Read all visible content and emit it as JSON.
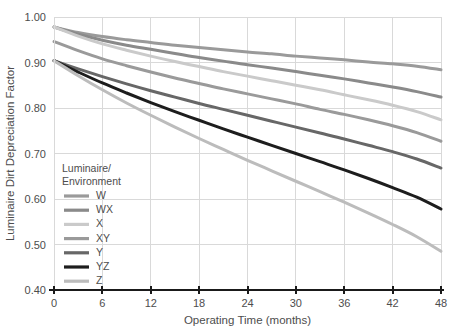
{
  "chart_data": {
    "type": "line",
    "title": "",
    "xlabel": "Operating Time (months)",
    "ylabel": "Luminaire Dirt Depreciation Factor",
    "xlim": [
      0,
      48
    ],
    "ylim": [
      0.4,
      1.0
    ],
    "xticks": [
      0,
      6,
      12,
      18,
      24,
      30,
      36,
      42,
      48
    ],
    "xtick_labels": [
      "0",
      "6",
      "12",
      "18",
      "24",
      "30",
      "36",
      "42",
      "48"
    ],
    "yticks": [
      0.4,
      0.5,
      0.6,
      0.7,
      0.8,
      0.9,
      1.0
    ],
    "ytick_labels": [
      "0.40",
      "0.50",
      "0.60",
      "0.70",
      "0.80",
      "0.90",
      "1.00"
    ],
    "grid": true,
    "legend_position": "inner-left-lower",
    "legend_title_lines": [
      "Luminaire/",
      "Environment"
    ],
    "x": [
      0,
      3,
      6,
      9,
      12,
      15,
      18,
      21,
      24,
      27,
      30,
      33,
      36,
      39,
      42,
      45,
      48
    ],
    "series": [
      {
        "name": "W",
        "color": "#9a9a9a",
        "width": 3.0,
        "values": [
          0.978,
          0.966,
          0.957,
          0.95,
          0.944,
          0.938,
          0.933,
          0.928,
          0.923,
          0.919,
          0.914,
          0.91,
          0.906,
          0.901,
          0.897,
          0.892,
          0.884
        ]
      },
      {
        "name": "WX",
        "color": "#8a8a8a",
        "width": 3.0,
        "values": [
          0.978,
          0.962,
          0.949,
          0.938,
          0.929,
          0.92,
          0.911,
          0.903,
          0.895,
          0.888,
          0.88,
          0.872,
          0.864,
          0.855,
          0.846,
          0.836,
          0.824
        ]
      },
      {
        "name": "X",
        "color": "#cacaca",
        "width": 3.0,
        "values": [
          0.978,
          0.958,
          0.941,
          0.927,
          0.914,
          0.902,
          0.891,
          0.88,
          0.87,
          0.86,
          0.85,
          0.84,
          0.829,
          0.818,
          0.806,
          0.792,
          0.774
        ]
      },
      {
        "name": "XY",
        "color": "#9a9a9a",
        "width": 3.0,
        "values": [
          0.946,
          0.926,
          0.908,
          0.893,
          0.879,
          0.866,
          0.854,
          0.842,
          0.831,
          0.82,
          0.809,
          0.797,
          0.786,
          0.774,
          0.761,
          0.746,
          0.727
        ]
      },
      {
        "name": "Y",
        "color": "#676767",
        "width": 3.0,
        "values": [
          0.904,
          0.886,
          0.869,
          0.853,
          0.838,
          0.824,
          0.81,
          0.797,
          0.784,
          0.771,
          0.758,
          0.745,
          0.732,
          0.718,
          0.704,
          0.688,
          0.668
        ]
      },
      {
        "name": "YZ",
        "color": "#1d1d1d",
        "width": 3.0,
        "values": [
          0.904,
          0.879,
          0.855,
          0.833,
          0.812,
          0.792,
          0.773,
          0.754,
          0.736,
          0.718,
          0.7,
          0.682,
          0.664,
          0.645,
          0.625,
          0.604,
          0.578
        ]
      },
      {
        "name": "Z",
        "color": "#bcbcbc",
        "width": 3.0,
        "values": [
          0.904,
          0.871,
          0.84,
          0.811,
          0.784,
          0.758,
          0.733,
          0.709,
          0.685,
          0.662,
          0.639,
          0.616,
          0.593,
          0.569,
          0.544,
          0.517,
          0.485
        ]
      }
    ]
  }
}
